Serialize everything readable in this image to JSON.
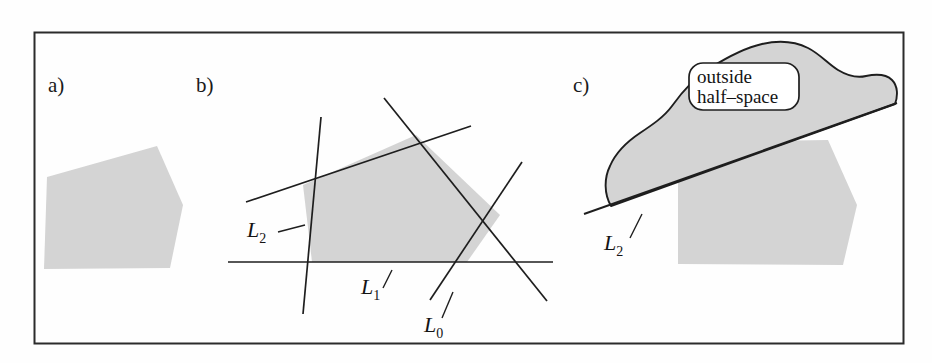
{
  "figure": {
    "background_color": "#fefefe",
    "frame": {
      "stroke_color": "#2b2b2b",
      "x": 34,
      "y": 32,
      "width": 869,
      "height": 311
    },
    "shading_color": "#d4d4d4",
    "outline_color": "#1e1e1e"
  },
  "panels": [
    {
      "id": "a",
      "label": "a)",
      "label_x": 48,
      "label_y": 92,
      "description": "shaded convex polygon",
      "polygon_points": "47,177 157,146 183,205 170,268 44,269"
    },
    {
      "id": "b",
      "label": "b)",
      "label_x": 196,
      "label_y": 92,
      "description": "convex polygon formed by intersecting half-space lines",
      "polygon_points": "303,185 312,262 467,262 500,215 416,135",
      "lines": [
        {
          "name": "L2",
          "x1": 321,
          "y1": 117,
          "x2": 303,
          "y2": 314
        },
        {
          "name": "upper-left-edge",
          "x1": 246,
          "y1": 202,
          "x2": 471,
          "y2": 126
        },
        {
          "name": "L1",
          "x1": 228,
          "y1": 262,
          "x2": 553,
          "y2": 262
        },
        {
          "name": "L0",
          "x1": 384,
          "y1": 98,
          "x2": 547,
          "y2": 301
        },
        {
          "name": "right-diagonal",
          "x1": 522,
          "y1": 162,
          "x2": 430,
          "y2": 300
        }
      ],
      "line_labels": [
        {
          "text": "L",
          "sub": "2",
          "x": 247,
          "y": 237,
          "leader": "278,232 305,225"
        },
        {
          "text": "L",
          "sub": "1",
          "x": 361,
          "y": 294,
          "leader": "383,288 392,272"
        },
        {
          "text": "L",
          "sub": "0",
          "x": 424,
          "y": 332,
          "leader": "442,318 452,292"
        }
      ]
    },
    {
      "id": "c",
      "label": "c)",
      "label_x": 573,
      "label_y": 92,
      "description": "shaded blob labelled outside half-space above line L2, overlapping a shaded polygon",
      "polygon_points": "678,142 828,140 857,205 843,265 678,264",
      "blob_path": "M 618,163 C 617,140 643,116 672,104 C 700,92 715,78 742,65 C 768,52 797,42 818,42 C 840,42 854,52 862,62 C 870,72 872,82 880,82 C 890,82 898,78 906,82 C 914,86 890,105 890,105 L 618,200 Z",
      "line": {
        "name": "L2",
        "x1": 584,
        "y1": 214,
        "x2": 896,
        "y2": 103
      },
      "line_label": {
        "text": "L",
        "sub": "2",
        "x": 609,
        "y": 248,
        "leader": "632,236 644,216"
      },
      "callout": {
        "x": 689,
        "y": 63,
        "width": 108,
        "height": 46,
        "radius": 13,
        "fill": "#ffffff",
        "lines": [
          "outside",
          "half–space"
        ]
      }
    }
  ]
}
